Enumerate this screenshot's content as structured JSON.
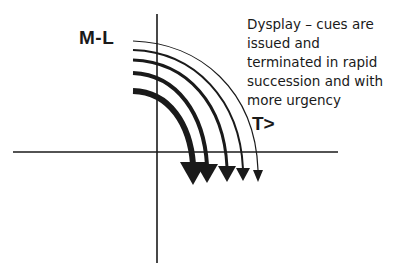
{
  "diagram": {
    "y_axis_label": "M-L",
    "x_axis_label": "T>",
    "description_lines": [
      "Dysplay – cues are",
      "issued and",
      "terminated in rapid",
      "succession and with",
      "more urgency"
    ],
    "colors": {
      "ink": "#1a1a1a",
      "background": "#ffffff"
    },
    "axes": {
      "horizontal": {
        "x1": 13,
        "x2": 338,
        "y": 152
      },
      "vertical": {
        "x": 157,
        "y1": 14,
        "y2": 263
      }
    },
    "arrows": [
      {
        "id": 1,
        "start_y": 41,
        "end_x": 258,
        "stroke": 1.2,
        "head": 8
      },
      {
        "id": 2,
        "start_y": 50,
        "end_x": 243,
        "stroke": 2,
        "head": 10
      },
      {
        "id": 3,
        "start_y": 60,
        "end_x": 227,
        "stroke": 3,
        "head": 13
      },
      {
        "id": 4,
        "start_y": 73,
        "end_x": 207,
        "stroke": 4,
        "head": 16
      },
      {
        "id": 5,
        "start_y": 91,
        "end_x": 193,
        "stroke": 6,
        "head": 20
      }
    ]
  }
}
